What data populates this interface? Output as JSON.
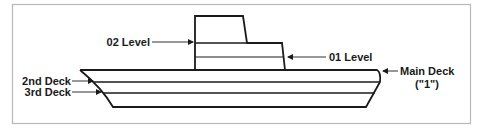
{
  "diagram": {
    "type": "ship-deck-levels",
    "labels": {
      "level_02": "02 Level",
      "level_01": "01 Level",
      "main_deck": "Main Deck",
      "main_deck_number": "(\"1\")",
      "deck_2": "2nd Deck",
      "deck_3": "3rd Deck"
    },
    "colors": {
      "line": "#1a1a1a",
      "frame": "#b8b8b8",
      "background": "#ffffff"
    }
  }
}
